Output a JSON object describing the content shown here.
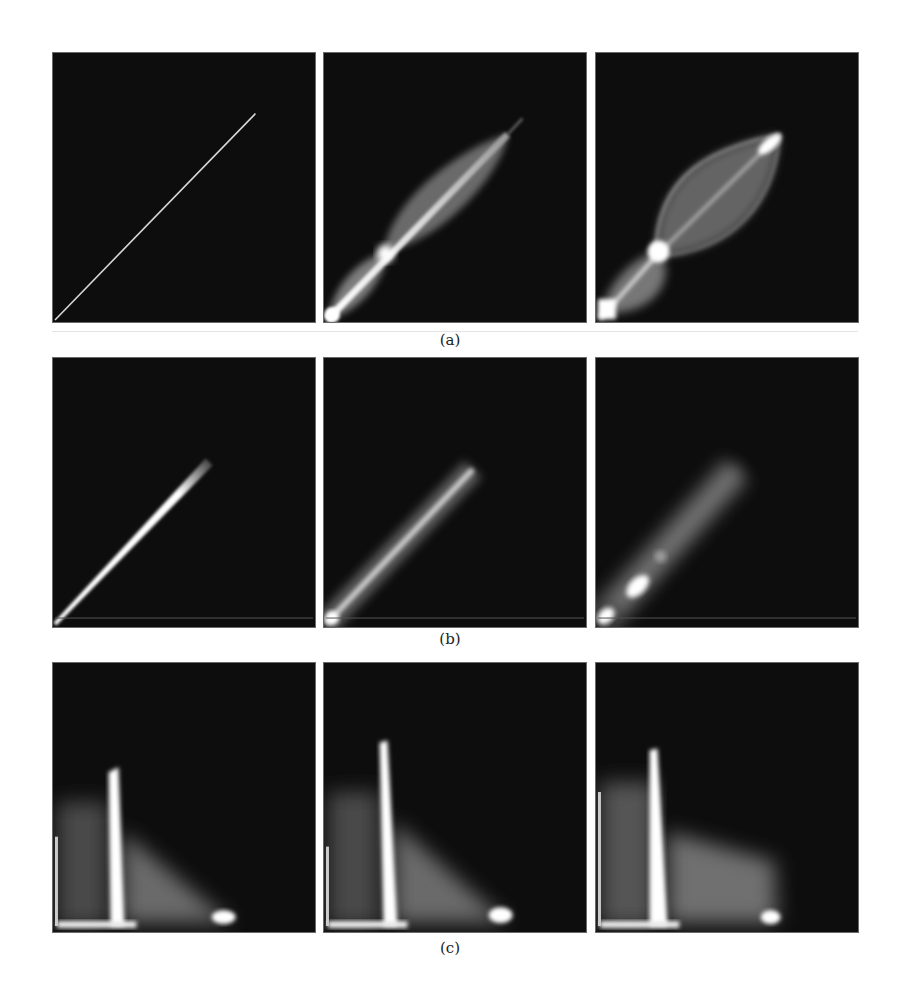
{
  "figure": {
    "rows": [
      {
        "id": "a",
        "label": "(a)",
        "description": "Phase-space density plots: thin diagonal line evolving into lens-shaped filamented distributions",
        "panels": [
          {
            "index": 1,
            "description": "thin diagonal line from bottom-left to upper-right"
          },
          {
            "index": 2,
            "description": "elongated lens shape along diagonal with pinch near lower-left"
          },
          {
            "index": 3,
            "description": "wide lens shape with bright cross-over knot and lower-left lobe"
          }
        ]
      },
      {
        "id": "b",
        "label": "(b)",
        "description": "Diagonal streaks broadening over time",
        "panels": [
          {
            "index": 1,
            "description": "narrow bright diagonal streak"
          },
          {
            "index": 2,
            "description": "broader diffuse diagonal streak"
          },
          {
            "index": 3,
            "description": "diffuse streak with two bright blobs near lower-left"
          }
        ]
      },
      {
        "id": "c",
        "label": "(c)",
        "description": "Vertical bright filament with diffuse wedge extending to lower-right",
        "panels": [
          {
            "index": 1,
            "description": "vertical bright filament with diffuse fan"
          },
          {
            "index": 2,
            "description": "vertical bright filament with diffuse fan"
          },
          {
            "index": 3,
            "description": "vertical bright filament with broader fan and bright corner"
          }
        ]
      }
    ],
    "colors": {
      "background": "#ffffff",
      "panel_bg": "#0d0d0d",
      "feature": "#ffffff",
      "label_text": "#222222"
    }
  }
}
